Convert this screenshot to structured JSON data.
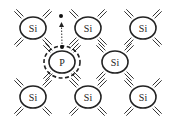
{
  "diagram": {
    "colors": {
      "stroke": "#222222",
      "background": "#ffffff"
    },
    "atoms": [
      {
        "label": "Si",
        "x": 33,
        "y": 28
      },
      {
        "label": "Si",
        "x": 88,
        "y": 28
      },
      {
        "label": "Si",
        "x": 143,
        "y": 28
      },
      {
        "label": "P",
        "x": 62,
        "y": 62,
        "dopant": true
      },
      {
        "label": "Si",
        "x": 115,
        "y": 62
      },
      {
        "label": "Si",
        "x": 33,
        "y": 97
      },
      {
        "label": "Si",
        "x": 88,
        "y": 97
      },
      {
        "label": "Si",
        "x": 143,
        "y": 97
      }
    ],
    "free_electron": {
      "from": [
        62,
        47
      ],
      "to": [
        61,
        16
      ]
    }
  }
}
